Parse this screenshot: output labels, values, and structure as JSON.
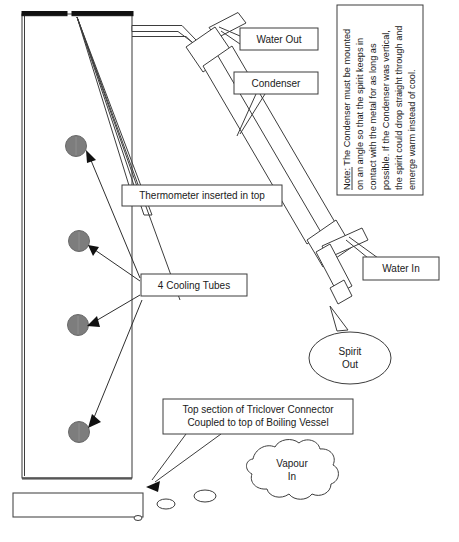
{
  "diagram": {
    "background_color": "#ffffff",
    "line_color": "#3d3d3d",
    "cooling_tube_color": "#7d7d7d"
  },
  "note_box": {
    "orientation": "rotated-90",
    "label_prefix": "Note:",
    "lines": [
      "Note: The Condenser must be mounted",
      "on an angle so that the spirit keeps in",
      "contact with the metal for as long as",
      "possible.   If the Condenser was vertical,",
      "the spirit could drop straight through and",
      "emerge warm instead of cool."
    ]
  },
  "callouts": [
    {
      "id": "water-out",
      "label": "Water Out"
    },
    {
      "id": "condenser",
      "label": "Condenser"
    },
    {
      "id": "thermometer",
      "label": "Thermometer inserted in top"
    },
    {
      "id": "cooling-tubes",
      "label": "4 Cooling Tubes"
    },
    {
      "id": "water-in",
      "label": "Water In"
    },
    {
      "id": "triclover",
      "label_line1": "Top section of Triclover Connector",
      "label_line2": "Coupled to top of Boiling Vessel"
    }
  ],
  "bubbles": [
    {
      "id": "spirit-out",
      "line1": "Spirit",
      "line2": "Out",
      "shape": "ellipse-callout"
    },
    {
      "id": "vapour-in",
      "line1": "Vapour",
      "line2": "In",
      "shape": "cloud"
    }
  ],
  "cooling_tubes": {
    "count": 4,
    "fill": "#7d7d7d"
  }
}
